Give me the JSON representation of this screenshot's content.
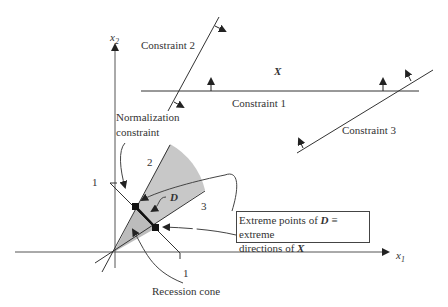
{
  "diagram": {
    "axes": {
      "x1": {
        "label": "x",
        "sub": "1"
      },
      "x2": {
        "label": "x",
        "sub": "2"
      }
    },
    "constraints": {
      "c1": "Constraint 1",
      "c2": "Constraint 2",
      "c3": "Constraint 3"
    },
    "region_label": "X",
    "normalization_label_line1": "Normalization",
    "normalization_label_line2": "constraint",
    "set_D_label": "D",
    "ray_labels": {
      "ray2": "2",
      "ray3": "3"
    },
    "intercept_labels": {
      "x2_intercept": "1",
      "x1_intercept": "1"
    },
    "recession_cone_label": "Recession cone",
    "callout": {
      "part1": "Extreme points of ",
      "D": "D",
      "part2": " ≡  extreme",
      "part3": "directions of ",
      "X": "X"
    },
    "colors": {
      "line": "#333333",
      "cone_fill": "#c8c8c8",
      "background": "#ffffff"
    }
  }
}
